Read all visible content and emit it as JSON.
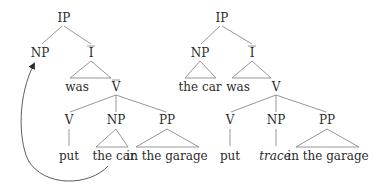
{
  "diagram": {
    "type": "syntax-tree-pair",
    "left_tree": {
      "root": "IP",
      "subject": "NP",
      "ibar": "I",
      "aux": "was",
      "vbar": "V",
      "verb_node": "V",
      "object_node": "NP",
      "pp_node": "PP",
      "verb": "put",
      "object": "the car",
      "pp": "in the garage"
    },
    "right_tree": {
      "root": "IP",
      "subject": "NP",
      "subject_text": "the car",
      "ibar": "I",
      "aux": "was",
      "vp": "V",
      "verb_node": "V",
      "object_node": "NP",
      "pp_node": "PP",
      "verb": "put",
      "object": "trace",
      "pp": "in the garage"
    },
    "movement_arrow": {
      "from": "the car",
      "to": "NP"
    },
    "colors": {
      "text": "#2b2b2b",
      "branch": "#8a8a8a",
      "arrow": "#4a4a4a",
      "background": "#ffffff"
    }
  }
}
